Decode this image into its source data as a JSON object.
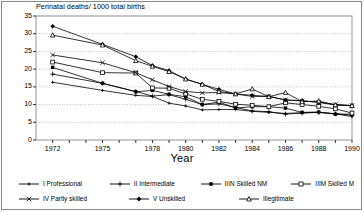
{
  "chart_data": {
    "type": "line",
    "title": "Perinatal deaths/ 1000 total births",
    "xlabel": "Year",
    "ylabel": "",
    "xlim": [
      1971,
      1990
    ],
    "ylim": [
      0,
      35
    ],
    "yticks": [
      0,
      5,
      10,
      15,
      20,
      25,
      30,
      35
    ],
    "xticks": [
      1972,
      1975,
      1978,
      1980,
      1982,
      1984,
      1986,
      1988,
      1990
    ],
    "xtick_labels": [
      "1972",
      "1975",
      "1978",
      "1980",
      "1982",
      "1984",
      "1986",
      "1988",
      "1990"
    ],
    "ytick_labels": [
      "0",
      "5",
      "10",
      "15",
      "20",
      "25",
      "30",
      "35"
    ],
    "x": [
      1972,
      1975,
      1977,
      1978,
      1979,
      1980,
      1981,
      1982,
      1983,
      1984,
      1985,
      1986,
      1987,
      1988,
      1989,
      1990
    ],
    "grid": true,
    "legend_position": "bottom",
    "series": [
      {
        "name": "I Professional",
        "marker": "plus-small",
        "values": [
          16.3,
          14.0,
          12.6,
          12.3,
          10.4,
          9.6,
          8.5,
          8.6,
          8.6,
          8.1,
          7.8,
          7.5,
          7.7,
          7.8,
          7.4,
          6.6
        ]
      },
      {
        "name": "II Intermediate",
        "marker": "plus",
        "values": [
          18.6,
          16.0,
          13.7,
          12.4,
          12.8,
          11.5,
          10.0,
          10.2,
          9.2,
          8.2,
          8.0,
          7.3,
          7.6,
          7.8,
          7.4,
          7.0
        ]
      },
      {
        "name": "IIIN Skilled NM",
        "marker": "filled-square",
        "values": [
          20.5,
          16.0,
          13.6,
          14.0,
          12.9,
          12.2,
          10.0,
          10.7,
          9.0,
          9.4,
          9.4,
          9.0,
          7.8,
          7.9,
          7.3,
          7.3
        ]
      },
      {
        "name": "IIIM Skilled M",
        "marker": "open-square",
        "values": [
          22.0,
          19.0,
          18.9,
          14.7,
          14.6,
          13.0,
          11.5,
          10.9,
          10.1,
          9.8,
          9.4,
          10.5,
          10.0,
          9.5,
          8.8,
          7.6
        ]
      },
      {
        "name": "IV Partly skilled",
        "marker": "x-cross",
        "values": [
          24.0,
          21.8,
          19.0,
          17.0,
          15.1,
          13.7,
          13.3,
          13.4,
          13.0,
          12.3,
          12.3,
          11.3,
          11.0,
          10.7,
          10.0,
          9.7
        ]
      },
      {
        "name": "V Unskilled",
        "marker": "filled-diamond",
        "values": [
          32.1,
          27.0,
          23.5,
          21.0,
          19.6,
          17.2,
          15.7,
          14.3,
          13.0,
          12.6,
          12.3,
          11.3,
          11.1,
          10.6,
          9.9,
          9.7
        ]
      },
      {
        "name": "Illegitimate",
        "marker": "open-triangle",
        "values": [
          29.6,
          26.8,
          22.4,
          20.8,
          19.3,
          17.2,
          15.7,
          13.7,
          13.0,
          14.4,
          12.2,
          13.4,
          10.8,
          11.0,
          9.9,
          9.7
        ]
      }
    ]
  }
}
